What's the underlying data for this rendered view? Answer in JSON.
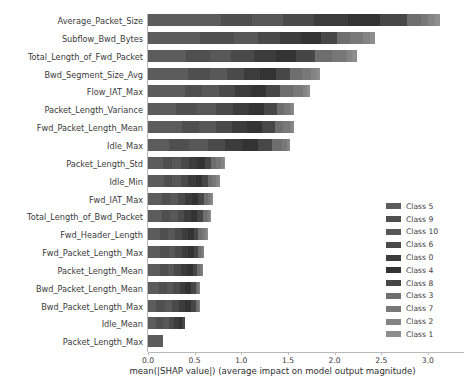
{
  "chart_data": {
    "type": "bar",
    "orientation": "horizontal",
    "stacked": true,
    "title": "",
    "xlabel": "mean(|SHAP value|) (average impact on model output magnitude)",
    "ylabel": "",
    "xlim": [
      0.0,
      3.35
    ],
    "xticks": [
      0.0,
      0.5,
      1.0,
      1.5,
      2.0,
      2.5,
      3.0
    ],
    "xticklabels": [
      "0.0",
      "0.5",
      "1.0",
      "1.5",
      "2.0",
      "2.5",
      "3.0"
    ],
    "grid": false,
    "legend_position": "center right",
    "categories": [
      "Average_Packet_Size",
      "Subflow_Bwd_Bytes",
      "Total_Length_of_Fwd_Packet",
      "Bwd_Segment_Size_Avg",
      "Flow_IAT_Max",
      "Packet_Length_Variance",
      "Fwd_Packet_Length_Mean",
      "Idle_Max",
      "Packet_Length_Std",
      "Idle_Min",
      "Fwd_IAT_Max",
      "Total_Length_of_Bwd_Packet",
      "Fwd_Header_Length",
      "Fwd_Packet_Length_Max",
      "Packet_Length_Mean",
      "Bwd_Packet_Length_Mean",
      "Bwd_Packet_Length_Max",
      "Idle_Mean",
      "Packet_Length_Max"
    ],
    "totals": [
      3.13,
      2.43,
      2.24,
      1.84,
      1.74,
      1.56,
      1.56,
      1.52,
      0.83,
      0.77,
      0.7,
      0.68,
      0.64,
      0.6,
      0.59,
      0.56,
      0.56,
      0.4,
      0.16
    ],
    "series": [
      {
        "name": "Class 5",
        "color": "#5c5c5c",
        "values": [
          0.78,
          0.56,
          0.41,
          0.43,
          0.4,
          0.3,
          0.36,
          0.22,
          0.16,
          0.17,
          0.15,
          0.15,
          0.13,
          0.13,
          0.13,
          0.12,
          0.09,
          0.09,
          0.16
        ]
      },
      {
        "name": "Class 9",
        "color": "#4f4f4f",
        "values": [
          0.33,
          0.36,
          0.25,
          0.23,
          0.18,
          0.23,
          0.19,
          0.22,
          0.1,
          0.09,
          0.09,
          0.09,
          0.08,
          0.09,
          0.08,
          0.08,
          0.09,
          0.07,
          0.0
        ]
      },
      {
        "name": "Class 10",
        "color": "#585858",
        "values": [
          0.34,
          0.26,
          0.23,
          0.19,
          0.18,
          0.2,
          0.18,
          0.2,
          0.09,
          0.09,
          0.08,
          0.08,
          0.08,
          0.07,
          0.07,
          0.07,
          0.08,
          0.06,
          0.0
        ]
      },
      {
        "name": "Class 6",
        "color": "#4a4a4a",
        "values": [
          0.33,
          0.24,
          0.25,
          0.18,
          0.17,
          0.18,
          0.17,
          0.19,
          0.09,
          0.08,
          0.08,
          0.07,
          0.07,
          0.07,
          0.07,
          0.07,
          0.07,
          0.06,
          0.0
        ]
      },
      {
        "name": "Class 0",
        "color": "#3c3c3c",
        "values": [
          0.36,
          0.22,
          0.23,
          0.17,
          0.17,
          0.17,
          0.16,
          0.18,
          0.09,
          0.08,
          0.07,
          0.07,
          0.07,
          0.07,
          0.07,
          0.06,
          0.07,
          0.05,
          0.0
        ]
      },
      {
        "name": "Class 4",
        "color": "#333333",
        "values": [
          0.35,
          0.21,
          0.22,
          0.17,
          0.17,
          0.16,
          0.16,
          0.17,
          0.08,
          0.07,
          0.07,
          0.07,
          0.06,
          0.06,
          0.06,
          0.06,
          0.06,
          0.04,
          0.0
        ]
      },
      {
        "name": "Class 8",
        "color": "#474747",
        "values": [
          0.29,
          0.18,
          0.2,
          0.15,
          0.15,
          0.14,
          0.14,
          0.15,
          0.07,
          0.06,
          0.06,
          0.06,
          0.05,
          0.05,
          0.05,
          0.05,
          0.05,
          0.03,
          0.0
        ]
      },
      {
        "name": "Class 3",
        "color": "#6e6e6e",
        "values": [
          0.15,
          0.14,
          0.18,
          0.13,
          0.13,
          0.08,
          0.09,
          0.11,
          0.05,
          0.05,
          0.04,
          0.04,
          0.04,
          0.03,
          0.03,
          0.03,
          0.03,
          0.0,
          0.0
        ]
      },
      {
        "name": "Class 7",
        "color": "#787878",
        "values": [
          0.07,
          0.13,
          0.16,
          0.1,
          0.11,
          0.06,
          0.07,
          0.05,
          0.05,
          0.04,
          0.03,
          0.03,
          0.03,
          0.02,
          0.02,
          0.01,
          0.01,
          0.0,
          0.0
        ]
      },
      {
        "name": "Class 2",
        "color": "#848484",
        "values": [
          0.08,
          0.08,
          0.06,
          0.06,
          0.05,
          0.03,
          0.03,
          0.02,
          0.03,
          0.03,
          0.02,
          0.01,
          0.02,
          0.01,
          0.01,
          0.01,
          0.01,
          0.0,
          0.0
        ]
      },
      {
        "name": "Class 1",
        "color": "#8e8e8e",
        "values": [
          0.05,
          0.05,
          0.05,
          0.03,
          0.03,
          0.01,
          0.01,
          0.01,
          0.02,
          0.01,
          0.01,
          0.01,
          0.01,
          0.0,
          0.0,
          0.0,
          0.0,
          0.0,
          0.0
        ]
      }
    ]
  },
  "legend": {
    "entries": [
      {
        "label": "Class 5"
      },
      {
        "label": "Class 9"
      },
      {
        "label": "Class 10"
      },
      {
        "label": "Class 6"
      },
      {
        "label": "Class 0"
      },
      {
        "label": "Class 4"
      },
      {
        "label": "Class 8"
      },
      {
        "label": "Class 3"
      },
      {
        "label": "Class 7"
      },
      {
        "label": "Class 2"
      },
      {
        "label": "Class 1"
      }
    ]
  },
  "colors": {
    "background": "#ffffff",
    "axis": "#b9b9b9",
    "text": "#3b3b3b"
  }
}
